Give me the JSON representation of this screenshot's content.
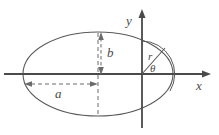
{
  "figure": {
    "width": 219,
    "height": 135,
    "background_color": "#ffffff",
    "stroke_color": "#595959",
    "axis_color": "#4a4a4a",
    "dash_color": "#6b6b6b",
    "label_color": "#4a4a4a"
  },
  "axes": {
    "x_label": "x",
    "y_label": "y",
    "origin_x": 142,
    "origin_y": 74
  },
  "ellipse": {
    "center_x": 98,
    "center_y": 74,
    "semi_major_rx": 75,
    "semi_minor_ry": 42
  },
  "annotations": {
    "semi_major_label": "a",
    "semi_minor_label": "b",
    "radius_label": "r",
    "angle_label": "θ"
  }
}
